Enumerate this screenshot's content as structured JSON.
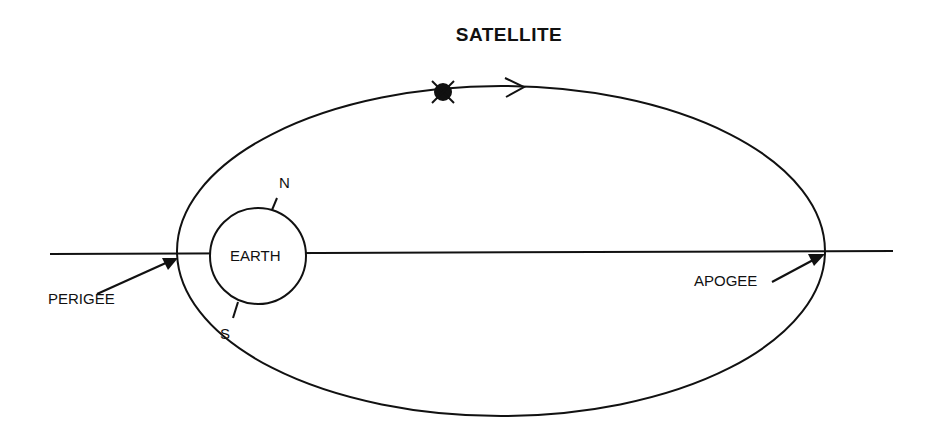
{
  "diagram": {
    "title": "SATELLITE",
    "labels": {
      "earth": "EARTH",
      "north": "N",
      "south": "S",
      "perigee": "PERIGEE",
      "apogee": "APOGEE"
    },
    "icons": {
      "satellite": "satellite-icon",
      "direction_arrow": "orbit-direction-arrow-icon"
    },
    "colors": {
      "line": "#111111",
      "background": "#ffffff"
    }
  }
}
